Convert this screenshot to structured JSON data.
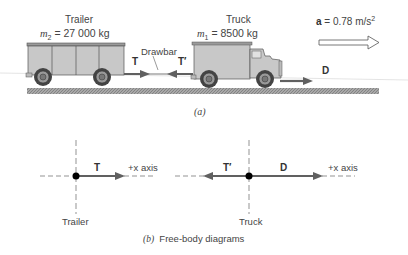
{
  "figure_a": {
    "caption": "(a)",
    "trailer": {
      "name": "Trailer",
      "mass_symbol": "m",
      "mass_subscript": "2",
      "mass_value": " = 27 000 kg"
    },
    "truck": {
      "name": "Truck",
      "mass_symbol": "m",
      "mass_subscript": "1",
      "mass_value": " = 8500 kg"
    },
    "drawbar_label": "Drawbar",
    "force_T": "T",
    "force_T_prime": "T′",
    "force_D": "D",
    "acceleration": {
      "symbol": "a",
      "value": " = 0.78 m/s",
      "exponent": "2"
    }
  },
  "figure_b": {
    "caption_label": "(b)",
    "caption_text": "Free-body diagrams",
    "trailer_fbd": {
      "label": "Trailer",
      "force": "T",
      "axis_label": "+x axis"
    },
    "truck_fbd": {
      "label": "Truck",
      "force_left": "T′",
      "force_right": "D",
      "axis_label": "+x axis"
    }
  },
  "colors": {
    "vehicle_fill": "#c8c8c8",
    "vehicle_stroke": "#555555",
    "arrow": "#606060",
    "ground": "#9a9a9a",
    "dot": "#000000"
  }
}
